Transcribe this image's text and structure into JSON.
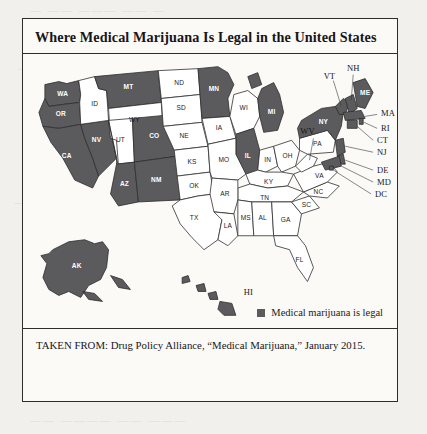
{
  "figure": {
    "title": "Where Medical Marijuana Is Legal in the United States",
    "source": "TAKEN FROM: Drug Policy Alliance, “Medical Marijuana,” January 2015."
  },
  "legend": {
    "swatch_color": "#5b5b5d",
    "label": "Medical marijuana is legal"
  },
  "colors": {
    "legal_fill": "#5b5b5d",
    "illegal_fill": "#ffffff",
    "outline": "#2d2d2d",
    "paper": "#fbfaf7",
    "page_background": "#f2f0ec"
  },
  "map": {
    "type": "choropleth",
    "region": "United States",
    "legal_states": [
      "WA",
      "OR",
      "CA",
      "NV",
      "MT",
      "AZ",
      "NM",
      "CO",
      "MN",
      "MI",
      "IL",
      "NY",
      "VT",
      "NH",
      "ME",
      "MA",
      "RI",
      "CT",
      "NJ",
      "DE",
      "MD",
      "DC",
      "AK",
      "HI"
    ],
    "illegal_states": [
      "ID",
      "WY",
      "UT",
      "ND",
      "SD",
      "NE",
      "KS",
      "OK",
      "TX",
      "IA",
      "MO",
      "AR",
      "LA",
      "MS",
      "AL",
      "GA",
      "FL",
      "SC",
      "NC",
      "TN",
      "KY",
      "IN",
      "OH",
      "WV",
      "VA",
      "PA",
      "WI"
    ],
    "inset_labels": [
      "AK",
      "HI"
    ],
    "leader_line_labels": [
      "NH",
      "VT",
      "MA",
      "RI",
      "CT",
      "NJ",
      "DE",
      "MD",
      "DC",
      "WV",
      "WI",
      "MI",
      "MN"
    ],
    "state_labels": [
      "WA",
      "OR",
      "CA",
      "NV",
      "ID",
      "MT",
      "WY",
      "UT",
      "CO",
      "AZ",
      "NM",
      "ND",
      "SD",
      "NE",
      "KS",
      "OK",
      "TX",
      "MN",
      "IA",
      "MO",
      "AR",
      "LA",
      "MS",
      "AL",
      "GA",
      "FL",
      "SC",
      "NC",
      "TN",
      "KY",
      "IN",
      "OH",
      "IL",
      "MI",
      "WI",
      "WV",
      "VA",
      "PA",
      "NY",
      "VT",
      "NH",
      "ME",
      "MA",
      "RI",
      "CT",
      "NJ",
      "DE",
      "MD",
      "DC",
      "AK",
      "HI"
    ]
  },
  "scan_artifacts": {
    "line_1": "— —— ——— —— —",
    "line_2": "—— ———— —— ——— ——",
    "line_3": "——— —— ———— ——",
    "line_4": "—— ——— —— ————",
    "line_5": "—— ———— —— ———"
  }
}
